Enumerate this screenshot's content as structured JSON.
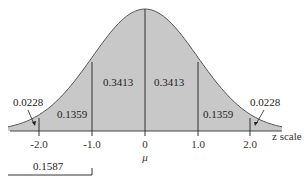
{
  "chart_data": {
    "type": "area",
    "title": "",
    "xlabel": "z scale",
    "ylabel": "",
    "distribution": "standard normal",
    "x_ticks": [
      "-2.0",
      "-1.0",
      "0",
      "1.0",
      "2.0"
    ],
    "x_tick_values": [
      -2.0,
      -1.0,
      0,
      1.0,
      2.0
    ],
    "mean_label": "μ",
    "regions": [
      {
        "from": "-inf",
        "to": -2.0,
        "area": 0.0228,
        "label": "0.0228"
      },
      {
        "from": -2.0,
        "to": -1.0,
        "area": 0.1359,
        "label": "0.1359"
      },
      {
        "from": -1.0,
        "to": 0,
        "area": 0.3413,
        "label": "0.3413"
      },
      {
        "from": 0,
        "to": 1.0,
        "area": 0.3413,
        "label": "0.3413"
      },
      {
        "from": 1.0,
        "to": 2.0,
        "area": 0.1359,
        "label": "0.1359"
      },
      {
        "from": 2.0,
        "to": "inf",
        "area": 0.0228,
        "label": "0.0228"
      }
    ],
    "bracket": {
      "from": "-inf",
      "to": -1.0,
      "area": 0.1587,
      "label": "0.1587"
    },
    "xlim": [
      -2.6,
      2.6
    ],
    "grid": false,
    "fill_color": "#c8c8c8",
    "line_color": "#555555"
  },
  "labels": {
    "left_tail": "0.0228",
    "left_outer": "0.1359",
    "left_inner": "0.3413",
    "right_inner": "0.3413",
    "right_outer": "0.1359",
    "right_tail": "0.0228",
    "bracket": "0.1587",
    "axis": "z scale",
    "mu": "μ",
    "ticks": [
      "-2.0",
      "-1.0",
      "0",
      "1.0",
      "2.0"
    ]
  }
}
